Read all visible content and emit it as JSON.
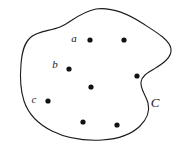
{
  "figure": {
    "background_color": "#ffffff",
    "stroke_color": "#1a1a1a",
    "dot_color": "#111111",
    "curve": {
      "label": "C",
      "label_x": 155,
      "label_y": 102,
      "stroke_width": 1.1,
      "path": "M 96 9 C 112 7, 128 14, 142 23 C 156 32, 170 40, 171 49 C 172 58, 162 64, 154 69 C 147 73, 142 76, 141 82 C 140 89, 146 95, 148 103 C 150 111, 147 119, 140 126 C 132 134, 118 139, 102 140 C 84 141, 66 138, 52 131 C 38 124, 28 113, 24 101 C 20 89, 20 76, 21 64 C 22 52, 24 43, 31 37 C 38 31, 50 31, 60 27 C 70 23, 80 12, 96 9 Z"
    },
    "points": [
      {
        "name": "point-a",
        "x": 90,
        "y": 40,
        "r": 2.6,
        "label": "a",
        "label_x": 74,
        "label_y": 38
      },
      {
        "name": "point-2",
        "x": 124,
        "y": 40,
        "r": 2.6,
        "label": "",
        "label_x": 0,
        "label_y": 0
      },
      {
        "name": "point-b",
        "x": 69,
        "y": 69,
        "r": 2.6,
        "label": "b",
        "label_x": 55,
        "label_y": 64
      },
      {
        "name": "point-4",
        "x": 137,
        "y": 76,
        "r": 2.6,
        "label": "",
        "label_x": 0,
        "label_y": 0
      },
      {
        "name": "point-5",
        "x": 91,
        "y": 87,
        "r": 2.6,
        "label": "",
        "label_x": 0,
        "label_y": 0
      },
      {
        "name": "point-c",
        "x": 48,
        "y": 101,
        "r": 2.6,
        "label": "c",
        "label_x": 34,
        "label_y": 99
      },
      {
        "name": "point-7",
        "x": 83,
        "y": 122,
        "r": 2.6,
        "label": "",
        "label_x": 0,
        "label_y": 0
      },
      {
        "name": "point-8",
        "x": 117,
        "y": 125,
        "r": 2.6,
        "label": "",
        "label_x": 0,
        "label_y": 0
      }
    ]
  }
}
